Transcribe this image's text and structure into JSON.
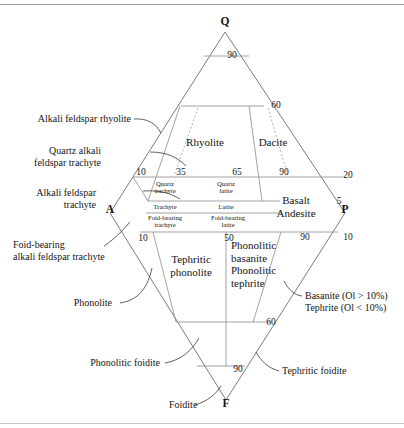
{
  "figure": {
    "kind": "qapf-volcanic-classification-diagram"
  },
  "vertices": [
    {
      "key": "Q",
      "label": "Q",
      "x": 225,
      "y": 25
    },
    {
      "key": "A",
      "label": "A",
      "x": 110,
      "y": 213
    },
    {
      "key": "P",
      "label": "P",
      "x": 345,
      "y": 213
    },
    {
      "key": "F",
      "label": "F",
      "x": 226,
      "y": 407
    }
  ],
  "tick_labels": [
    {
      "label": "90",
      "x": 232,
      "y": 58
    },
    {
      "label": "60",
      "x": 276,
      "y": 108
    },
    {
      "label": "10",
      "x": 141,
      "y": 175
    },
    {
      "label": "35",
      "x": 181,
      "y": 175
    },
    {
      "label": "65",
      "x": 237,
      "y": 175
    },
    {
      "label": "90",
      "x": 284,
      "y": 175
    },
    {
      "label": "20",
      "x": 348,
      "y": 178
    },
    {
      "label": "5",
      "x": 339,
      "y": 204
    },
    {
      "label": "10",
      "x": 143,
      "y": 241
    },
    {
      "label": "50",
      "x": 229,
      "y": 241
    },
    {
      "label": "90",
      "x": 305,
      "y": 240
    },
    {
      "label": "10",
      "x": 348,
      "y": 240
    },
    {
      "label": "60",
      "x": 271,
      "y": 325
    },
    {
      "label": "90",
      "x": 238,
      "y": 372
    }
  ],
  "fields_inner": [
    {
      "name": "quartz-trachyte",
      "lines": [
        "Quartz",
        "trachyte"
      ],
      "x": 165,
      "y": 186
    },
    {
      "name": "quartz-latite",
      "lines": [
        "Quartz",
        "latite"
      ],
      "x": 226,
      "y": 186
    },
    {
      "name": "trachyte",
      "lines": [
        "Trachyte"
      ],
      "x": 165,
      "y": 209
    },
    {
      "name": "latite",
      "lines": [
        "Latite"
      ],
      "x": 226,
      "y": 209
    },
    {
      "name": "foid-bearing-trachyte",
      "lines": [
        "Foid-bearing",
        "trachyte"
      ],
      "x": 165,
      "y": 220
    },
    {
      "name": "foid-bearing-latite",
      "lines": [
        "Foid-bearing",
        "latite"
      ],
      "x": 228,
      "y": 220
    }
  ],
  "fields_major": [
    {
      "name": "rhyolite",
      "lines": [
        "Rhyolite"
      ],
      "x": 205,
      "y": 146,
      "anchor": "middle"
    },
    {
      "name": "dacite",
      "lines": [
        "Dacite"
      ],
      "x": 273,
      "y": 146,
      "anchor": "middle"
    },
    {
      "name": "basalt-andesite",
      "lines": [
        "Basalt",
        "Andesite"
      ],
      "x": 296,
      "y": 204,
      "anchor": "middle"
    },
    {
      "name": "tephritic-phonolite",
      "lines": [
        "Tephritic",
        "phonolite"
      ],
      "x": 191,
      "y": 263,
      "anchor": "middle"
    },
    {
      "name": "phonolitic-basanite-tephrite",
      "lines": [
        "Phonolitic",
        "basanite",
        "Phonolitic",
        "tephrite"
      ],
      "x": 231,
      "y": 249,
      "anchor": "start"
    }
  ],
  "callouts": [
    {
      "name": "alkali-feldspar-rhyolite",
      "lines": [
        "Alkali feldspar rhyolite"
      ],
      "x": 131,
      "y": 122,
      "anchor": "end"
    },
    {
      "name": "quartz-alkali-feldspar-trachyte",
      "lines": [
        "Quartz alkali",
        "feldspar trachyte"
      ],
      "x": 101,
      "y": 154,
      "anchor": "end"
    },
    {
      "name": "alkali-feldspar-trachyte",
      "lines": [
        "Alkali feldspar",
        "trachyte"
      ],
      "x": 96,
      "y": 196,
      "anchor": "end"
    },
    {
      "name": "foid-bearing-alkali-feldspar-trachyte",
      "lines": [
        "Foid-bearing",
        "alkali feldspar trachyte"
      ],
      "x": 13,
      "y": 248,
      "anchor": "start"
    },
    {
      "name": "phonolite",
      "lines": [
        "Phonolite"
      ],
      "x": 112,
      "y": 306,
      "anchor": "end"
    },
    {
      "name": "phonolitic-foidite",
      "lines": [
        "Phonolitic foidite"
      ],
      "x": 160,
      "y": 366,
      "anchor": "end"
    },
    {
      "name": "foidite",
      "lines": [
        "Foidite"
      ],
      "x": 169,
      "y": 408,
      "anchor": "start"
    },
    {
      "name": "tephritic-foidite",
      "lines": [
        "Tephritic foidite"
      ],
      "x": 282,
      "y": 374,
      "anchor": "start"
    },
    {
      "name": "basanite-tephrite-olivine",
      "lines": [
        "Basanite (Ol > 10%)",
        "Tephrite (Ol < 10%)"
      ],
      "x": 305,
      "y": 299,
      "anchor": "start"
    }
  ],
  "geometry": {
    "outline": "M225,32 L110,213 L226,400 L345,213 Z",
    "grid_lines": [
      "M204,56 L249,56",
      "M181,106 L264,106",
      "M133,177 L343,177",
      "M148,201 L280,201",
      "M146,213 L282,213",
      "M140,232 L338,232",
      "M176,322 L270,322",
      "M197,366 L245,366",
      "M226,232 L226,366",
      "M133,177 L148,201",
      "M180,106 L148,201",
      "M249,106 L262,201",
      "M153,232 L176,322",
      "M281,232 L253,322"
    ],
    "dashed_lines": [
      "M198,108 L174,176",
      "M268,108 L288,176"
    ],
    "leaders": [
      "M134,119 C148,118 156,124 161,133",
      "M150,152 C168,152 178,158 186,166",
      "M143,191 C160,190 170,193 180,199",
      "M104,246 C116,238 123,230 130,222",
      "M120,303 C140,300 148,286 152,268",
      "M165,363 C182,360 192,350 199,338",
      "M195,405 C208,401 216,394 221,386",
      "M279,371 C268,368 261,361 256,352",
      "M302,296 C294,295 288,289 284,281"
    ]
  }
}
